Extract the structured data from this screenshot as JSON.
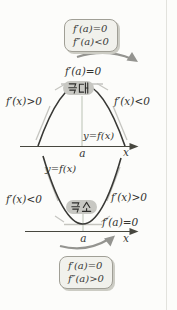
{
  "top": {
    "callout_line1": "f′(a)=0",
    "callout_line2": "f″(a)<0",
    "tangent_zero_label": "f′(a)=0",
    "badge": "극대",
    "slope_left": "f′(x)>0",
    "slope_right": "f′(x)<0",
    "curve_label": "y=f(x)",
    "point_a": "a",
    "axis_x": "x"
  },
  "bottom": {
    "callout_line1": "f′(a)=0",
    "callout_line2": "f″(a)>0",
    "tangent_zero_label": "f′(a)=0",
    "badge": "극소",
    "slope_left": "f′(x)<0",
    "slope_right": "f′(x)>0",
    "curve_label": "y=f(x)",
    "point_a": "a",
    "axis_x": "x"
  },
  "colors": {
    "curve": "#383835",
    "axis": "#47473f",
    "tangent": "#c5c5c0",
    "guide_line": "#cdd3c8",
    "rotation_arrow": "#949490",
    "badge_bg": "#c7c7c2",
    "callout_bg": "#f1f1ec",
    "callout_border": "#a09f96",
    "background": "#fcfcfa"
  }
}
